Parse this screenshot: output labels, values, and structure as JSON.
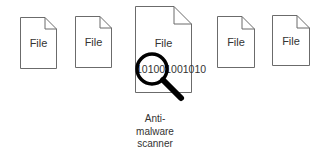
{
  "diagram": {
    "files": [
      {
        "label": "File"
      },
      {
        "label": "File"
      },
      {
        "label": "File",
        "content": "101001001010",
        "scanned": true
      },
      {
        "label": "File"
      },
      {
        "label": "File"
      }
    ],
    "scanner": {
      "icon": "magnifying-glass-icon",
      "caption_lines": [
        "Anti-",
        "malware",
        "scanner"
      ]
    },
    "colors": {
      "outline": "#666666",
      "magnifier": "#000000",
      "background": "#ffffff"
    }
  }
}
